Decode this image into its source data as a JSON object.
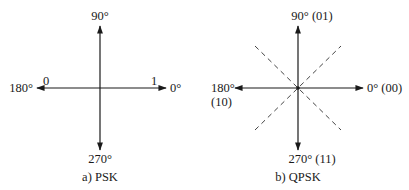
{
  "diagrams": [
    {
      "id": "psk",
      "caption": "a) PSK",
      "labels": {
        "top": "90°",
        "left": "180°",
        "right": "0°",
        "bottom": "270°",
        "bit_left": "0",
        "bit_right": "1"
      }
    },
    {
      "id": "qpsk",
      "caption": "b) QPSK",
      "labels": {
        "top": "90° (01)",
        "left_line1": "180°",
        "left_line2": "(10)",
        "right": "0° (00)",
        "bottom": "270° (11)"
      }
    }
  ],
  "colors": {
    "line": "#1a1a1a",
    "dashed": "#444444",
    "background": "#ffffff"
  }
}
